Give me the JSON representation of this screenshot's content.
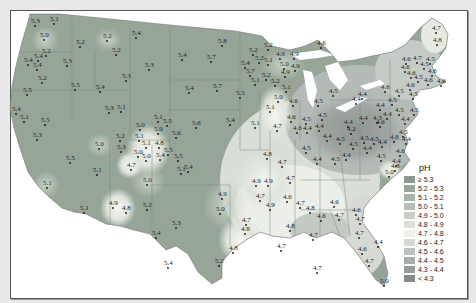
{
  "map": {
    "subject": "Precipitation pH, contiguous United States",
    "legend": {
      "title": "pH",
      "items": [
        {
          "label": "≥ 5.3",
          "color": "#8a9a8c"
        },
        {
          "label": "5.2 - 5.3",
          "color": "#97a698"
        },
        {
          "label": "5.1 - 5.2",
          "color": "#a6b3a7"
        },
        {
          "label": "5.0 - 5.1",
          "color": "#b6c1b6"
        },
        {
          "label": "4.9 - 5.0",
          "color": "#c8d0c6"
        },
        {
          "label": "4.8 - 4.9",
          "color": "#dbe1d8"
        },
        {
          "label": "4.7 - 4.8",
          "color": "#eef0ea"
        },
        {
          "label": "4.6 - 4.7",
          "color": "#d4d8d2"
        },
        {
          "label": "4.5 - 4.6",
          "color": "#bcc2be"
        },
        {
          "label": "4.4 - 4.5",
          "color": "#a7aeaa"
        },
        {
          "label": "4.3 - 4.4",
          "color": "#959c99"
        },
        {
          "label": "< 4.3",
          "color": "#848b89"
        }
      ]
    },
    "stations": [
      {
        "x": 35,
        "y": 23,
        "v": "5.3"
      },
      {
        "x": 54,
        "y": 21,
        "v": "5.1"
      },
      {
        "x": 44,
        "y": 37,
        "v": "5.0"
      },
      {
        "x": 80,
        "y": 44,
        "v": "5.2"
      },
      {
        "x": 107,
        "y": 38,
        "v": "5.2"
      },
      {
        "x": 136,
        "y": 35,
        "v": "5.4"
      },
      {
        "x": 46,
        "y": 53,
        "v": "5.2"
      },
      {
        "x": 38,
        "y": 58,
        "v": "5.4"
      },
      {
        "x": 28,
        "y": 62,
        "v": "5.4"
      },
      {
        "x": 37,
        "y": 67,
        "v": "5.4"
      },
      {
        "x": 67,
        "y": 63,
        "v": "5.3"
      },
      {
        "x": 116,
        "y": 52,
        "v": "5.2"
      },
      {
        "x": 149,
        "y": 67,
        "v": "5.3"
      },
      {
        "x": 126,
        "y": 78,
        "v": "5.3"
      },
      {
        "x": 42,
        "y": 80,
        "v": "5.2"
      },
      {
        "x": 75,
        "y": 87,
        "v": "5.5"
      },
      {
        "x": 100,
        "y": 89,
        "v": "5.4"
      },
      {
        "x": 27,
        "y": 92,
        "v": "5.5"
      },
      {
        "x": 16,
        "y": 111,
        "v": "5.4"
      },
      {
        "x": 24,
        "y": 119,
        "v": "5.1"
      },
      {
        "x": 45,
        "y": 122,
        "v": "5.5"
      },
      {
        "x": 37,
        "y": 137,
        "v": "5.3"
      },
      {
        "x": 109,
        "y": 110,
        "v": "5.3"
      },
      {
        "x": 121,
        "y": 109,
        "v": "5.1"
      },
      {
        "x": 99,
        "y": 146,
        "v": "5.0"
      },
      {
        "x": 120,
        "y": 138,
        "v": "5.2"
      },
      {
        "x": 121,
        "y": 149,
        "v": "5.3"
      },
      {
        "x": 70,
        "y": 160,
        "v": "5.5"
      },
      {
        "x": 97,
        "y": 172,
        "v": "5.1"
      },
      {
        "x": 47,
        "y": 185,
        "v": "5.1"
      },
      {
        "x": 113,
        "y": 205,
        "v": "4.9"
      },
      {
        "x": 126,
        "y": 210,
        "v": "4.8"
      },
      {
        "x": 84,
        "y": 210,
        "v": "5.1"
      },
      {
        "x": 147,
        "y": 207,
        "v": "5.2"
      },
      {
        "x": 131,
        "y": 167,
        "v": "4.7"
      },
      {
        "x": 147,
        "y": 182,
        "v": "5.0"
      },
      {
        "x": 140,
        "y": 127,
        "v": "5.0"
      },
      {
        "x": 139,
        "y": 138,
        "v": "5.1"
      },
      {
        "x": 146,
        "y": 145,
        "v": "5.1"
      },
      {
        "x": 158,
        "y": 119,
        "v": "5.1"
      },
      {
        "x": 158,
        "y": 131,
        "v": "5.0"
      },
      {
        "x": 159,
        "y": 145,
        "v": "4.8"
      },
      {
        "x": 138,
        "y": 154,
        "v": "5.0"
      },
      {
        "x": 146,
        "y": 158,
        "v": "5.0"
      },
      {
        "x": 160,
        "y": 157,
        "v": "5.4"
      },
      {
        "x": 168,
        "y": 152,
        "v": "5.5"
      },
      {
        "x": 167,
        "y": 123,
        "v": "5.5"
      },
      {
        "x": 176,
        "y": 135,
        "v": "5.6"
      },
      {
        "x": 178,
        "y": 158,
        "v": "5.5"
      },
      {
        "x": 181,
        "y": 171,
        "v": "5.1"
      },
      {
        "x": 188,
        "y": 169,
        "v": "5.4"
      },
      {
        "x": 156,
        "y": 235,
        "v": "5.4"
      },
      {
        "x": 176,
        "y": 225,
        "v": "5.3"
      },
      {
        "x": 168,
        "y": 265,
        "v": "5.4"
      },
      {
        "x": 219,
        "y": 263,
        "v": "5.2"
      },
      {
        "x": 222,
        "y": 196,
        "v": "4.9"
      },
      {
        "x": 220,
        "y": 211,
        "v": "5.0"
      },
      {
        "x": 246,
        "y": 222,
        "v": "4.7"
      },
      {
        "x": 245,
        "y": 231,
        "v": "4.8"
      },
      {
        "x": 233,
        "y": 250,
        "v": "4.8"
      },
      {
        "x": 182,
        "y": 57,
        "v": "5.4"
      },
      {
        "x": 211,
        "y": 59,
        "v": "5.7"
      },
      {
        "x": 222,
        "y": 43,
        "v": "5.8"
      },
      {
        "x": 189,
        "y": 90,
        "v": "5.4"
      },
      {
        "x": 217,
        "y": 88,
        "v": "5.7"
      },
      {
        "x": 240,
        "y": 95,
        "v": "5.5"
      },
      {
        "x": 196,
        "y": 125,
        "v": "5.6"
      },
      {
        "x": 230,
        "y": 122,
        "v": "5.4"
      },
      {
        "x": 255,
        "y": 125,
        "v": "5.1"
      },
      {
        "x": 277,
        "y": 128,
        "v": "4.7"
      },
      {
        "x": 253,
        "y": 52,
        "v": "5.2"
      },
      {
        "x": 268,
        "y": 47,
        "v": "5.2"
      },
      {
        "x": 259,
        "y": 60,
        "v": "5.2"
      },
      {
        "x": 245,
        "y": 65,
        "v": "5.4"
      },
      {
        "x": 250,
        "y": 73,
        "v": "5.7"
      },
      {
        "x": 255,
        "y": 82,
        "v": "5.1"
      },
      {
        "x": 266,
        "y": 77,
        "v": "5.2"
      },
      {
        "x": 268,
        "y": 62,
        "v": "5.1"
      },
      {
        "x": 280,
        "y": 56,
        "v": "4.9"
      },
      {
        "x": 294,
        "y": 56,
        "v": "4.9"
      },
      {
        "x": 284,
        "y": 66,
        "v": "5.0"
      },
      {
        "x": 285,
        "y": 74,
        "v": "4.9"
      },
      {
        "x": 295,
        "y": 68,
        "v": "4.9"
      },
      {
        "x": 275,
        "y": 83,
        "v": "5.2"
      },
      {
        "x": 286,
        "y": 89,
        "v": "5.1"
      },
      {
        "x": 278,
        "y": 99,
        "v": "5.0"
      },
      {
        "x": 270,
        "y": 109,
        "v": "5.1"
      },
      {
        "x": 293,
        "y": 103,
        "v": "4.6"
      },
      {
        "x": 291,
        "y": 119,
        "v": "4.6"
      },
      {
        "x": 297,
        "y": 130,
        "v": "4.6"
      },
      {
        "x": 267,
        "y": 156,
        "v": "4.8"
      },
      {
        "x": 282,
        "y": 164,
        "v": "4.7"
      },
      {
        "x": 256,
        "y": 183,
        "v": "4.9"
      },
      {
        "x": 268,
        "y": 183,
        "v": "4.9"
      },
      {
        "x": 290,
        "y": 180,
        "v": "4.7"
      },
      {
        "x": 260,
        "y": 198,
        "v": "4.7"
      },
      {
        "x": 287,
        "y": 199,
        "v": "4.6"
      },
      {
        "x": 270,
        "y": 207,
        "v": "4.9"
      },
      {
        "x": 300,
        "y": 205,
        "v": "4.7"
      },
      {
        "x": 310,
        "y": 210,
        "v": "4.8"
      },
      {
        "x": 290,
        "y": 228,
        "v": "4.8"
      },
      {
        "x": 313,
        "y": 237,
        "v": "4.7"
      },
      {
        "x": 281,
        "y": 248,
        "v": "4.7"
      },
      {
        "x": 321,
        "y": 218,
        "v": "4.6"
      },
      {
        "x": 334,
        "y": 204,
        "v": "4.6"
      },
      {
        "x": 339,
        "y": 217,
        "v": "4.7"
      },
      {
        "x": 317,
        "y": 270,
        "v": "4.7"
      },
      {
        "x": 360,
        "y": 221,
        "v": "4.7"
      },
      {
        "x": 359,
        "y": 235,
        "v": "4.7"
      },
      {
        "x": 362,
        "y": 251,
        "v": "4.6"
      },
      {
        "x": 378,
        "y": 244,
        "v": "4.4"
      },
      {
        "x": 369,
        "y": 263,
        "v": "4.7"
      },
      {
        "x": 384,
        "y": 283,
        "v": "5.0"
      },
      {
        "x": 356,
        "y": 212,
        "v": "4.6"
      },
      {
        "x": 321,
        "y": 45,
        "v": "4.6"
      },
      {
        "x": 333,
        "y": 93,
        "v": "4.5"
      },
      {
        "x": 318,
        "y": 103,
        "v": "4.5"
      },
      {
        "x": 306,
        "y": 121,
        "v": "4.5"
      },
      {
        "x": 307,
        "y": 130,
        "v": "4.4"
      },
      {
        "x": 319,
        "y": 128,
        "v": "4.4"
      },
      {
        "x": 327,
        "y": 138,
        "v": "4.4"
      },
      {
        "x": 306,
        "y": 150,
        "v": "4.5"
      },
      {
        "x": 340,
        "y": 141,
        "v": "4.5"
      },
      {
        "x": 348,
        "y": 124,
        "v": "4.4"
      },
      {
        "x": 363,
        "y": 120,
        "v": "4.4"
      },
      {
        "x": 351,
        "y": 131,
        "v": "4.2"
      },
      {
        "x": 377,
        "y": 120,
        "v": "4.3"
      },
      {
        "x": 367,
        "y": 150,
        "v": "4.4"
      },
      {
        "x": 387,
        "y": 116,
        "v": "4.4"
      },
      {
        "x": 403,
        "y": 134,
        "v": "4.5"
      },
      {
        "x": 380,
        "y": 124,
        "v": "4.6"
      },
      {
        "x": 382,
        "y": 144,
        "v": "4.4"
      },
      {
        "x": 400,
        "y": 153,
        "v": "4.6"
      },
      {
        "x": 396,
        "y": 163,
        "v": "4.4"
      },
      {
        "x": 381,
        "y": 158,
        "v": "4.5"
      },
      {
        "x": 395,
        "y": 168,
        "v": "4.8"
      },
      {
        "x": 389,
        "y": 174,
        "v": "5.0"
      },
      {
        "x": 394,
        "y": 139,
        "v": "4.8"
      },
      {
        "x": 380,
        "y": 107,
        "v": "4.4"
      },
      {
        "x": 392,
        "y": 102,
        "v": "4.5"
      },
      {
        "x": 399,
        "y": 112,
        "v": "4.5"
      },
      {
        "x": 356,
        "y": 101,
        "v": "4.4"
      },
      {
        "x": 362,
        "y": 96,
        "v": "4.4"
      },
      {
        "x": 385,
        "y": 89,
        "v": "4.6"
      },
      {
        "x": 399,
        "y": 93,
        "v": "4.5"
      },
      {
        "x": 410,
        "y": 87,
        "v": "4.6"
      },
      {
        "x": 413,
        "y": 96,
        "v": "4.5"
      },
      {
        "x": 428,
        "y": 82,
        "v": "4.6"
      },
      {
        "x": 441,
        "y": 83,
        "v": "4.6"
      },
      {
        "x": 405,
        "y": 69,
        "v": "4.6"
      },
      {
        "x": 411,
        "y": 75,
        "v": "4.6"
      },
      {
        "x": 430,
        "y": 61,
        "v": "4.5"
      },
      {
        "x": 424,
        "y": 66,
        "v": "4.5"
      },
      {
        "x": 406,
        "y": 61,
        "v": "4.6"
      },
      {
        "x": 417,
        "y": 60,
        "v": "4.7"
      },
      {
        "x": 432,
        "y": 73,
        "v": "4.6"
      },
      {
        "x": 437,
        "y": 42,
        "v": "4.8"
      },
      {
        "x": 436,
        "y": 30,
        "v": "4.7"
      },
      {
        "x": 418,
        "y": 79,
        "v": "4.5"
      },
      {
        "x": 414,
        "y": 112,
        "v": "4.5"
      },
      {
        "x": 405,
        "y": 121,
        "v": "4.4"
      },
      {
        "x": 406,
        "y": 141,
        "v": "4.4"
      },
      {
        "x": 374,
        "y": 141,
        "v": "4.5"
      },
      {
        "x": 364,
        "y": 140,
        "v": "4.5"
      },
      {
        "x": 322,
        "y": 117,
        "v": "4.5"
      },
      {
        "x": 317,
        "y": 161,
        "v": "4.4"
      },
      {
        "x": 335,
        "y": 161,
        "v": "4.5"
      },
      {
        "x": 346,
        "y": 157,
        "v": "4.4"
      },
      {
        "x": 353,
        "y": 146,
        "v": "4.5"
      }
    ]
  }
}
